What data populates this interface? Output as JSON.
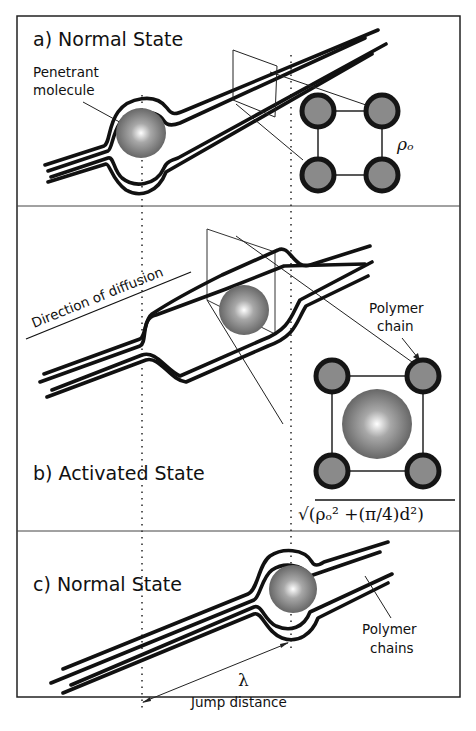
{
  "figure": {
    "panels": [
      {
        "id": "a",
        "title": "a)  Normal State",
        "labels": {
          "penetrant_line1": "Penetrant",
          "penetrant_line2": "molecule",
          "spacing_symbol": "ρₒ"
        }
      },
      {
        "id": "b",
        "title": "b)  Activated State",
        "labels": {
          "direction": "Direction of diffusion",
          "polymer_line1": "Polymer",
          "polymer_line2": "chain",
          "formula": "√(ρₒ²  +(π/4)d²)"
        }
      },
      {
        "id": "c",
        "title": "c)  Normal State",
        "labels": {
          "polymer_line1": "Polymer",
          "polymer_line2": "chains",
          "lambda": "λ",
          "jump": "Jump distance"
        }
      }
    ],
    "colors": {
      "line": "#111111",
      "chain_node_fill": "#8a8a8a",
      "background": "#ffffff"
    }
  }
}
